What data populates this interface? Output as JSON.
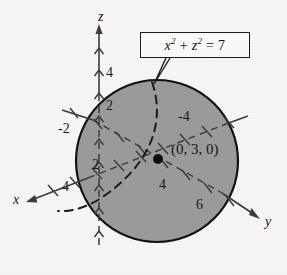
{
  "figure": {
    "background_color": "#f7f6f4",
    "sphere_fill_color": "#9b9b9b",
    "sphere_stroke_color": "#121212",
    "axis_color": "#3c3c3c",
    "dashed_curve_color": "#1b1b1b"
  },
  "callout": {
    "equation_plain": "x2 + z2 = 7",
    "lhs_base_1": "x",
    "exp_1": "2",
    "operator": "+",
    "lhs_base_2": "z",
    "exp_2": "2",
    "equals": "=",
    "rhs": "7"
  },
  "axes": {
    "z": {
      "label": "z",
      "direction": "up"
    },
    "x": {
      "label": "x",
      "direction": "down-left"
    },
    "y": {
      "label": "y",
      "direction": "down-right"
    }
  },
  "tick_labels": [
    {
      "id": "z-4",
      "text": "4",
      "axis": "z",
      "x": 106,
      "y": 66
    },
    {
      "id": "z-2",
      "text": "2",
      "axis": "z",
      "x": 106,
      "y": 99
    },
    {
      "id": "x-neg-4",
      "text": "-4",
      "axis": "x-negative",
      "x": 178,
      "y": 110
    },
    {
      "id": "y-neg-2",
      "text": "-2",
      "axis": "y-negative",
      "x": 58,
      "y": 122
    },
    {
      "id": "x-2",
      "text": "2",
      "axis": "x",
      "x": 92,
      "y": 158
    },
    {
      "id": "x-4",
      "text": "4",
      "axis": "x",
      "x": 62,
      "y": 180
    },
    {
      "id": "y-4",
      "text": "4",
      "axis": "y",
      "x": 159,
      "y": 178
    },
    {
      "id": "y-6",
      "text": "6",
      "axis": "y",
      "x": 196,
      "y": 198
    }
  ],
  "point": {
    "label": "(0, 3, 0)",
    "label_x": 171,
    "label_y": 142,
    "marker_x": 158,
    "marker_y": 159
  }
}
